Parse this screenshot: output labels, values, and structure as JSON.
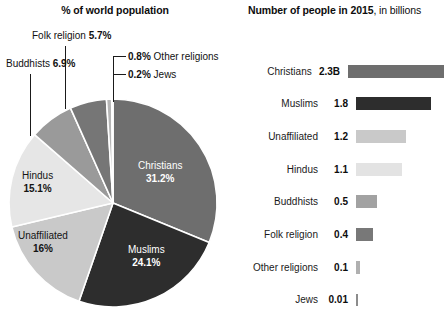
{
  "pie_panel": {
    "title": "% of world population",
    "callouts": [
      {
        "id": "folk",
        "name": "Folk religion",
        "value": "5.7%",
        "order": "name-first"
      },
      {
        "id": "buddhists",
        "name": "Buddhists",
        "value": "6.9%",
        "order": "name-first"
      },
      {
        "id": "other",
        "name": "Other religions",
        "value": "0.8%",
        "order": "value-first"
      },
      {
        "id": "jews",
        "name": "Jews",
        "value": "0.2%",
        "order": "value-first"
      }
    ],
    "slice_labels": [
      {
        "id": "christians",
        "name": "Christians",
        "value": "31.2%"
      },
      {
        "id": "muslims",
        "name": "Muslims",
        "value": "24.1%"
      },
      {
        "id": "unaffiliated",
        "name": "Unaffiliated",
        "value": "16%"
      },
      {
        "id": "hindus",
        "name": "Hindus",
        "value": "15.1%"
      }
    ]
  },
  "bar_panel": {
    "title_bold": "Number of people in 2015",
    "title_rest": ", in billions"
  },
  "chart_data": [
    {
      "type": "pie",
      "title": "% of world population",
      "unit": "percent",
      "categories": [
        "Christians",
        "Muslims",
        "Unaffiliated",
        "Hindus",
        "Buddhists",
        "Folk religion",
        "Other religions",
        "Jews"
      ],
      "values": [
        31.2,
        24.1,
        16,
        15.1,
        6.9,
        5.7,
        0.8,
        0.2
      ],
      "labels": [
        "31.2%",
        "24.1%",
        "16%",
        "15.1%",
        "6.9%",
        "5.7%",
        "0.8%",
        "0.2%"
      ],
      "colors": [
        "#6e6e6e",
        "#2d2d2d",
        "#c9c9c9",
        "#e6e6e6",
        "#9a9a9a",
        "#767676",
        "#b5b5b5",
        "#5a5a5a"
      ],
      "start_angle_deg": 0,
      "direction": "clockwise",
      "legend": "none",
      "label_placement": [
        "inside",
        "inside",
        "inside",
        "inside",
        "callout",
        "callout",
        "callout",
        "callout"
      ]
    },
    {
      "type": "bar",
      "orientation": "horizontal",
      "title": "Number of people in 2015, in billions",
      "xlabel": "",
      "ylabel": "",
      "xlim": [
        0,
        2.3
      ],
      "grid": false,
      "legend": "none",
      "categories": [
        "Christians",
        "Muslims",
        "Unaffiliated",
        "Hindus",
        "Buddhists",
        "Folk religion",
        "Other religions",
        "Jews"
      ],
      "values": [
        2.3,
        1.8,
        1.2,
        1.1,
        0.5,
        0.4,
        0.1,
        0.01
      ],
      "value_labels": [
        "2.3B",
        "1.8",
        "1.2",
        "1.1",
        "0.5",
        "0.4",
        "0.1",
        "0.01"
      ],
      "colors": [
        "#6e6e6e",
        "#2d2d2d",
        "#c9c9c9",
        "#e3e3e3",
        "#a2a2a2",
        "#787878",
        "#b0b0b0",
        "#8c8c8c"
      ]
    }
  ]
}
